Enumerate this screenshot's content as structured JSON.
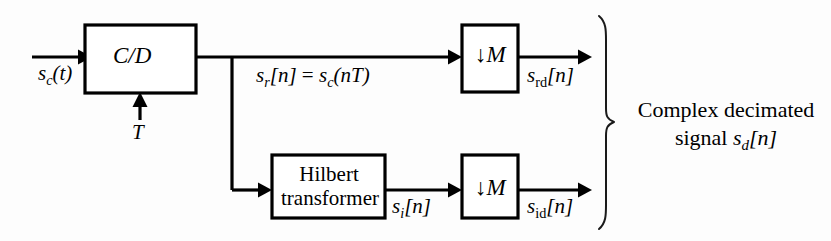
{
  "diagram": {
    "background_color": "#fdfdfd",
    "line_color": "#000000",
    "blocks": {
      "cd": {
        "label": "C/D"
      },
      "hilbert": {
        "line1": "Hilbert",
        "line2": "transformer"
      },
      "downsampler_top": {
        "arrow": "↓",
        "factor": "M"
      },
      "downsampler_bottom": {
        "arrow": "↓",
        "factor": "M"
      }
    },
    "signals": {
      "input": {
        "base": "s",
        "sub": "c",
        "arg": "(t)"
      },
      "clock": {
        "label": "T"
      },
      "real_branch": {
        "base": "s",
        "sub": "r",
        "arg": "[n]",
        "equals": " = ",
        "rhs_base": "s",
        "rhs_sub": "c",
        "rhs_arg": "(nT)"
      },
      "real_decimated": {
        "base": "s",
        "sub": "rd",
        "arg": "[n]"
      },
      "imag_branch": {
        "base": "s",
        "sub": "i",
        "arg": "[n]"
      },
      "imag_decimated": {
        "base": "s",
        "sub": "id",
        "arg": "[n]"
      }
    },
    "annotation": {
      "line1": "Complex decimated",
      "line2_prefix": "signal ",
      "line2_base": "s",
      "line2_sub": "d",
      "line2_arg": "[n]"
    }
  }
}
